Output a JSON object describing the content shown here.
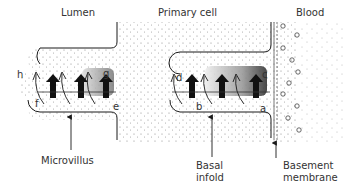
{
  "diagram": {
    "regions": {
      "lumen": "Lumen",
      "primary_cell": "Primary cell",
      "blood": "Blood"
    },
    "callouts": {
      "microvillus": "Microvillus",
      "basal_infold_line1": "Basal",
      "basal_infold_line2": "infold",
      "basement_membrane_line1": "Basement",
      "basement_membrane_line2": "membrane"
    },
    "letters": {
      "a": "a",
      "b": "b",
      "c": "c",
      "d": "d",
      "e": "e",
      "f": "f",
      "g": "g",
      "h": "h"
    },
    "colors": {
      "ink": "#1a1a1a",
      "stipple": "#888888",
      "background": "#ffffff"
    }
  }
}
